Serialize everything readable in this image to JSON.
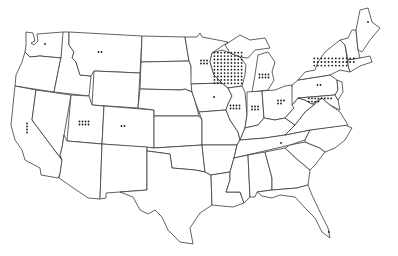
{
  "map": {
    "type": "dot-density",
    "region": "United States (contiguous)",
    "background": "#ffffff",
    "outline_color": "#3a3a3a",
    "dot_color": "#1a1a1a",
    "states": [
      {
        "id": "WA",
        "name": "Washington",
        "dots": 1
      },
      {
        "id": "OR",
        "name": "Oregon",
        "dots": 0
      },
      {
        "id": "CA",
        "name": "California",
        "dots": 4
      },
      {
        "id": "ID",
        "name": "Idaho",
        "dots": 0
      },
      {
        "id": "NV",
        "name": "Nevada",
        "dots": 0
      },
      {
        "id": "MT",
        "name": "Montana",
        "dots": 2
      },
      {
        "id": "WY",
        "name": "Wyoming",
        "dots": 0
      },
      {
        "id": "UT",
        "name": "Utah",
        "dots": 8
      },
      {
        "id": "AZ",
        "name": "Arizona",
        "dots": 0
      },
      {
        "id": "CO",
        "name": "Colorado",
        "dots": 2
      },
      {
        "id": "NM",
        "name": "New Mexico",
        "dots": 0
      },
      {
        "id": "ND",
        "name": "North Dakota",
        "dots": 0
      },
      {
        "id": "SD",
        "name": "South Dakota",
        "dots": 0
      },
      {
        "id": "NE",
        "name": "Nebraska",
        "dots": 0
      },
      {
        "id": "KS",
        "name": "Kansas",
        "dots": 0
      },
      {
        "id": "OK",
        "name": "Oklahoma",
        "dots": 0
      },
      {
        "id": "TX",
        "name": "Texas",
        "dots": 0
      },
      {
        "id": "MN",
        "name": "Minnesota",
        "dots": 6
      },
      {
        "id": "IA",
        "name": "Iowa",
        "dots": 1
      },
      {
        "id": "MO",
        "name": "Missouri",
        "dots": 0
      },
      {
        "id": "AR",
        "name": "Arkansas",
        "dots": 0
      },
      {
        "id": "LA",
        "name": "Louisiana",
        "dots": 0
      },
      {
        "id": "WI",
        "name": "Wisconsin",
        "dots": 90
      },
      {
        "id": "IL",
        "name": "Illinois",
        "dots": 8
      },
      {
        "id": "MI",
        "name": "Michigan",
        "dots": 8
      },
      {
        "id": "IN",
        "name": "Indiana",
        "dots": 6
      },
      {
        "id": "OH",
        "name": "Ohio",
        "dots": 5
      },
      {
        "id": "KY",
        "name": "Kentucky",
        "dots": 0
      },
      {
        "id": "TN",
        "name": "Tennessee",
        "dots": 1
      },
      {
        "id": "MS",
        "name": "Mississippi",
        "dots": 0
      },
      {
        "id": "AL",
        "name": "Alabama",
        "dots": 0
      },
      {
        "id": "GA",
        "name": "Georgia",
        "dots": 0
      },
      {
        "id": "FL",
        "name": "Florida",
        "dots": 1
      },
      {
        "id": "SC",
        "name": "South Carolina",
        "dots": 0
      },
      {
        "id": "NC",
        "name": "North Carolina",
        "dots": 0
      },
      {
        "id": "VA",
        "name": "Virginia",
        "dots": 0
      },
      {
        "id": "WV",
        "name": "West Virginia",
        "dots": 0
      },
      {
        "id": "PA",
        "name": "Pennsylvania",
        "dots": 2
      },
      {
        "id": "NY",
        "name": "New York",
        "dots": 34
      },
      {
        "id": "MD",
        "name": "Maryland",
        "dots": 12
      },
      {
        "id": "NJ",
        "name": "New Jersey",
        "dots": 0
      },
      {
        "id": "NE-states",
        "name": "New England",
        "dots": 0
      },
      {
        "id": "ME",
        "name": "Maine",
        "dots": 1
      }
    ]
  }
}
